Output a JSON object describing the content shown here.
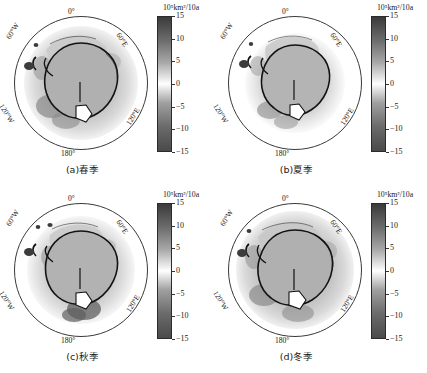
{
  "figure": {
    "panels": [
      {
        "id": "a",
        "caption": "(a)春季",
        "season_en": "Spring",
        "lon_labels": {
          "top": "0°",
          "bottom": "180°",
          "upper_left": "60°W",
          "upper_right": "60°E",
          "lower_left": "120°W",
          "lower_right": "120°E"
        },
        "colorbar": {
          "unit": "10⁵km²/10a",
          "ticks": [
            "15",
            "10",
            "5",
            "0",
            "-5",
            "-10",
            "-15"
          ],
          "max": 15,
          "min": -15,
          "high_color": "#3a3a3a",
          "mid_color": "#ffffff",
          "low_color": "#4a4a4a"
        }
      },
      {
        "id": "b",
        "caption": "(b)夏季",
        "season_en": "Summer",
        "lon_labels": {
          "top": "0°",
          "bottom": "180°",
          "upper_left": "60°W",
          "upper_right": "60°E",
          "lower_left": "120°W",
          "lower_right": "120°E"
        },
        "colorbar": {
          "unit": "10⁵km²/10a",
          "ticks": [
            "15",
            "10",
            "5",
            "0",
            "-5",
            "-10",
            "-15"
          ],
          "max": 15,
          "min": -15,
          "high_color": "#3a3a3a",
          "mid_color": "#ffffff",
          "low_color": "#4a4a4a"
        }
      },
      {
        "id": "c",
        "caption": "(c)秋季",
        "season_en": "Autumn",
        "lon_labels": {
          "top": "0°",
          "bottom": "180°",
          "upper_left": "60°W",
          "upper_right": "60°E",
          "lower_left": "120°W",
          "lower_right": "120°E"
        },
        "colorbar": {
          "unit": "10⁵km²/10a",
          "ticks": [
            "15",
            "10",
            "5",
            "0",
            "-5",
            "-10",
            "-15"
          ],
          "max": 15,
          "min": -15,
          "high_color": "#3a3a3a",
          "mid_color": "#ffffff",
          "low_color": "#4a4a4a"
        }
      },
      {
        "id": "d",
        "caption": "(d)冬季",
        "season_en": "Winter",
        "lon_labels": {
          "top": "0°",
          "bottom": "180°",
          "upper_left": "60°W",
          "upper_right": "60°E",
          "lower_left": "120°W",
          "lower_right": "120°E"
        },
        "colorbar": {
          "unit": "10⁵km²/10a",
          "ticks": [
            "15",
            "10",
            "5",
            "0",
            "-5",
            "-10",
            "-15"
          ],
          "max": 15,
          "min": -15,
          "high_color": "#3a3a3a",
          "mid_color": "#ffffff",
          "low_color": "#4a4a4a"
        }
      }
    ]
  },
  "chart_data": {
    "type": "heatmap",
    "title": "",
    "projection": "polar stereographic, South Pole",
    "grid": false,
    "legend_position": "right of each panel",
    "colorbar": {
      "unit": "10⁵km²/10a",
      "ticks": [
        15,
        10,
        5,
        0,
        -5,
        -10,
        -15
      ],
      "range": [
        -15,
        15
      ],
      "colormap": "grayscale diverging (dark-white-dark)"
    },
    "axis_labels": {
      "longitudes": [
        "0°",
        "60°E",
        "120°E",
        "180°",
        "120°W",
        "60°W"
      ]
    },
    "panels": [
      {
        "id": "a",
        "label": "(a)春季",
        "season": "Spring",
        "description": "Sea ice trend anomalies encircle the continent; broad light-to-mid gray belt over the Weddell and Indian Ocean sectors with darker negative patches along the Bellingshausen-Amundsen sector.",
        "regions": [
          {
            "name": "Weddell Sea",
            "value": 4
          },
          {
            "name": "Indian Ocean sector",
            "value": 3
          },
          {
            "name": "West Pacific sector",
            "value": 2
          },
          {
            "name": "Ross Sea",
            "value": 5
          },
          {
            "name": "Bellingshausen-Amundsen Sea",
            "value": -8
          }
        ]
      },
      {
        "id": "b",
        "label": "(b)夏季",
        "season": "Summer",
        "description": "Most compact ice extent of the four seasons; trends are weak and close to zero over much of the ocean, with a localized dark negative region near the Bellingshausen sector.",
        "regions": [
          {
            "name": "Weddell Sea",
            "value": 2
          },
          {
            "name": "Indian Ocean sector",
            "value": 1
          },
          {
            "name": "West Pacific sector",
            "value": 1
          },
          {
            "name": "Ross Sea",
            "value": 3
          },
          {
            "name": "Bellingshausen-Amundsen Sea",
            "value": -6
          }
        ]
      },
      {
        "id": "c",
        "label": "(c)秋季",
        "season": "Autumn",
        "description": "Pronounced dark negative anomaly south of the Ross/Amundsen sector; moderate positive values over the Weddell and Indian Ocean sectors.",
        "regions": [
          {
            "name": "Weddell Sea",
            "value": 3
          },
          {
            "name": "Indian Ocean sector",
            "value": 2
          },
          {
            "name": "West Pacific sector",
            "value": 2
          },
          {
            "name": "Ross Sea",
            "value": -9
          },
          {
            "name": "Bellingshausen-Amundsen Sea",
            "value": -7
          }
        ]
      },
      {
        "id": "d",
        "label": "(d)冬季",
        "season": "Winter",
        "description": "Largest ice extent; broad gray band extends far from the coast in the Weddell and Indian Ocean sectors, with scattered darker negative areas in the Amundsen-Bellingshausen sector.",
        "regions": [
          {
            "name": "Weddell Sea",
            "value": 5
          },
          {
            "name": "Indian Ocean sector",
            "value": 4
          },
          {
            "name": "West Pacific sector",
            "value": 3
          },
          {
            "name": "Ross Sea",
            "value": 4
          },
          {
            "name": "Bellingshausen-Amundsen Sea",
            "value": -6
          }
        ]
      }
    ]
  }
}
